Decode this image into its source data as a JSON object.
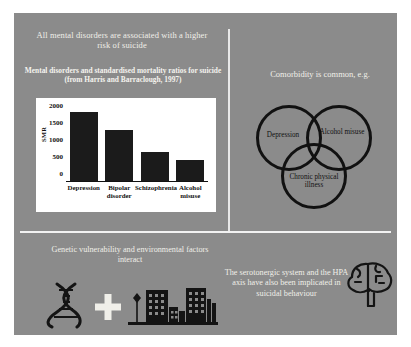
{
  "slide": {
    "background_color": "#8b8b8b",
    "text_color": "#f0efe9"
  },
  "panels": {
    "top_left": {
      "title": "All mental disorders are associated with a higher risk of suicide",
      "chart_caption": "Mental disorders and standardised mortality ratios for suicide (from Harris and Barraclough, 1997)"
    },
    "top_right": {
      "title": "Comorbidity is common, e.g.",
      "venn": {
        "labels": [
          "Depression",
          "Alcohol misuse",
          "Chronic physical illness"
        ],
        "stroke_color": "#111111"
      }
    },
    "bottom_left": {
      "title": "Genetic vulnerability and environmental factors interact",
      "icons": [
        "dna-icon",
        "plus-icon",
        "city-icon"
      ]
    },
    "bottom_right": {
      "title": "The serotonergic system and the HPA axis have also been implicated in suicidal behaviour",
      "icons": [
        "brain-icon"
      ]
    }
  },
  "chart_data": {
    "type": "bar",
    "title": "Mental disorders and standardised mortality ratios for suicide (from Harris and Barraclough, 1997)",
    "categories": [
      "Depression",
      "Bipolar disorder",
      "Schizophrenia",
      "Alcohol misuse"
    ],
    "values": [
      2030,
      1505,
      845,
      604
    ],
    "xlabel": "",
    "ylabel": "SMR",
    "ylim": [
      0,
      2200
    ],
    "yticks": [
      0,
      500,
      1000,
      1500,
      2000
    ],
    "grid": false,
    "legend": false,
    "bar_color": "#1b1b1b",
    "plot_background": "#ffffff"
  }
}
